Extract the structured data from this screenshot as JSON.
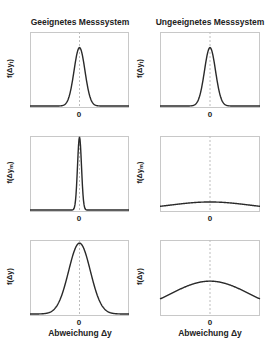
{
  "chart_data": [
    {
      "type": "line",
      "panel": "top-left",
      "column_title": "Geeignetes Messsystem",
      "ylabel": "f(Δy_t)",
      "xtick": "0",
      "sigma_rel": 0.055,
      "peak_rel": 0.8
    },
    {
      "type": "line",
      "panel": "top-right",
      "column_title": "Ungeeignetes Messsystem",
      "ylabel": "f(Δy_t)",
      "xtick": "0",
      "sigma_rel": 0.055,
      "peak_rel": 0.8
    },
    {
      "type": "line",
      "panel": "middle-left",
      "ylabel": "f(Δy_m)",
      "xtick": "0",
      "sigma_rel": 0.02,
      "peak_rel": 1.0
    },
    {
      "type": "line",
      "panel": "middle-right",
      "ylabel": "f(Δy_m)",
      "xtick": "0",
      "sigma_rel": 0.4,
      "peak_rel": 0.11
    },
    {
      "type": "line",
      "panel": "bottom-left",
      "ylabel": "f(Δy)",
      "xtick": "0",
      "xlabel": "Abweichung Δy",
      "sigma_rel": 0.11,
      "peak_rel": 0.97
    },
    {
      "type": "line",
      "panel": "bottom-right",
      "ylabel": "f(Δy)",
      "xtick": "0",
      "xlabel": "Abweichung Δy",
      "sigma_rel": 0.4,
      "peak_rel": 0.45
    }
  ],
  "titles": {
    "left": "Geeignetes Messsystem",
    "right": "Ungeeignetes Messsystem"
  },
  "ylabels": {
    "row1_base": "f(Δy",
    "row1_sub": "t",
    "row2_base": "f(Δy",
    "row2_sub": "m",
    "row3": "f(Δy)"
  },
  "tick_zero": "0",
  "xlabel": "Abweichung Δy",
  "colors": {
    "curve": "#2a2a2a",
    "frame": "#c8c8c8",
    "zero_line": "#bdbdbd"
  }
}
